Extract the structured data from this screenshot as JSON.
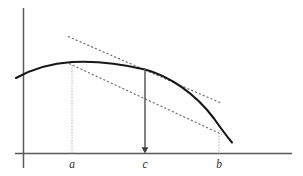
{
  "figure": {
    "title": ""
  },
  "chart_data": {
    "type": "line",
    "title": "",
    "xlabel": "",
    "ylabel": "",
    "grid": false,
    "legend": false,
    "xlim": [
      0,
      303
    ],
    "ylim": [
      176,
      0
    ],
    "axes": {
      "x_axis": {
        "x1": 15,
        "y1": 153.5,
        "x2": 292,
        "y2": 153.5,
        "width": 1.5,
        "color": "#58585a"
      },
      "y_axis": {
        "x1": 23.5,
        "y1": 8,
        "x2": 23.5,
        "y2": 168,
        "width": 1.5,
        "color": "#58585a"
      }
    },
    "tick_labels": [
      {
        "name": "a",
        "text": "a",
        "x": 72,
        "y": 168
      },
      {
        "name": "c",
        "text": "c",
        "x": 145,
        "y": 168
      },
      {
        "name": "b",
        "text": "b",
        "x": 219,
        "y": 168
      }
    ],
    "series": [
      {
        "name": "curve",
        "style": "solid",
        "color": "#171717",
        "path": "M 16 78 C 33 68.5, 52 63.3, 72 62.0 C 95 60.7, 120 63.5, 145 69.5 C 170 76.0, 196 94.5, 214 118.5 C 221 128.5, 227 136.5, 232 142.5"
      },
      {
        "name": "tangent-upper",
        "style": "dashed",
        "color": "#6d6d70",
        "points": [
          [
            68,
            36.5
          ],
          [
            222,
            103.5
          ]
        ]
      },
      {
        "name": "tangent-lower",
        "style": "dashed",
        "color": "#6d6d70",
        "points": [
          [
            69,
            63.5
          ],
          [
            222,
            134.5
          ]
        ]
      }
    ],
    "drop_lines": [
      {
        "name": "a",
        "x": 72,
        "y_top": 62.0,
        "y_bottom": 153.5,
        "color": "#a9a9ac"
      },
      {
        "name": "b",
        "x": 219,
        "y_top": 130.0,
        "y_bottom": 153.5,
        "color": "#a9a9ac"
      }
    ],
    "annotations": [
      {
        "name": "c-drop-arrow",
        "kind": "arrow",
        "x": 145,
        "y_top": 69.0,
        "y_bottom": 153.5,
        "direction": "down",
        "color": "#58585a"
      }
    ]
  }
}
